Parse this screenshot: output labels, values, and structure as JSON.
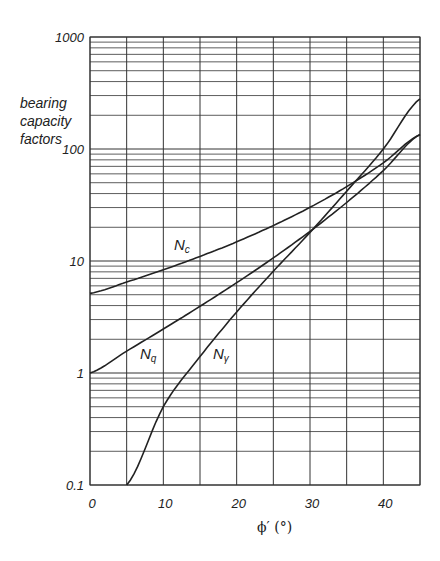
{
  "chart_data": {
    "type": "line",
    "title": "",
    "ylabel": "bearing capacity factors",
    "ylabel_lines": [
      "bearing",
      "capacity",
      "factors"
    ],
    "xlabel": "ϕ′ (°)",
    "yscale": "log",
    "xlim": [
      0,
      45
    ],
    "ylim": [
      0.1,
      1000
    ],
    "x_ticks": [
      0,
      10,
      20,
      30,
      40
    ],
    "x_tick_labels": [
      "0",
      "10",
      "20",
      "30",
      "40"
    ],
    "x_grid": [
      0,
      5,
      10,
      15,
      20,
      25,
      30,
      35,
      40,
      45
    ],
    "y_ticks": [
      0.1,
      1,
      10,
      100,
      1000
    ],
    "y_tick_labels": [
      "0.1",
      "1",
      "10",
      "100",
      "1000"
    ],
    "grid": true,
    "legend": "none (inline curve labels)",
    "series": [
      {
        "name": "Nc",
        "label": "N",
        "sub": "c",
        "x": [
          0,
          5,
          10,
          15,
          20,
          25,
          30,
          35,
          40,
          45
        ],
        "values": [
          5.14,
          6.49,
          8.35,
          10.98,
          14.83,
          20.72,
          30.14,
          46.12,
          75.31,
          133.9
        ]
      },
      {
        "name": "Nq",
        "label": "N",
        "sub": "q",
        "x": [
          0,
          5,
          10,
          15,
          20,
          25,
          30,
          35,
          40,
          45
        ],
        "values": [
          1.0,
          1.57,
          2.47,
          3.94,
          6.4,
          10.66,
          18.4,
          33.3,
          64.2,
          134.9
        ]
      },
      {
        "name": "Nγ",
        "label": "N",
        "sub": "γ",
        "x": [
          5,
          10,
          15,
          20,
          25,
          30,
          35,
          40,
          45
        ],
        "values": [
          0.1,
          0.5,
          1.4,
          3.5,
          8.1,
          18.0,
          42.0,
          100.0,
          280.0
        ]
      }
    ]
  },
  "labels": {
    "y_title_1": "bearing",
    "y_title_2": "capacity",
    "y_title_3": "factors",
    "x_title": "ϕ′ (°)",
    "nc_main": "N",
    "nc_sub": "c",
    "nq_main": "N",
    "nq_sub": "q",
    "ng_main": "N",
    "ng_sub": "γ"
  }
}
